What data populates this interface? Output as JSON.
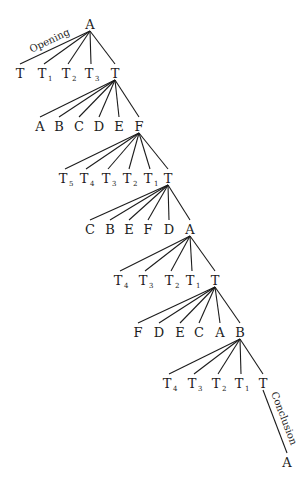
{
  "diagram": {
    "type": "tree",
    "ink_color": "#1c1c1c",
    "background": "#ffffff",
    "root": {
      "id": "n0",
      "label": "A",
      "sub": "",
      "x": 90,
      "y": 24
    },
    "levels": [
      {
        "parent": "n0",
        "nodes": [
          {
            "id": "l1_0",
            "label": "T",
            "sub": "",
            "x": 20,
            "y": 73
          },
          {
            "id": "l1_1",
            "label": "T",
            "sub": "1",
            "x": 44,
            "y": 73
          },
          {
            "id": "l1_2",
            "label": "T",
            "sub": "2",
            "x": 68,
            "y": 73
          },
          {
            "id": "l1_3",
            "label": "T",
            "sub": "3",
            "x": 91,
            "y": 73
          },
          {
            "id": "l1_4",
            "label": "T",
            "sub": "",
            "x": 115,
            "y": 73
          }
        ]
      },
      {
        "parent": "l1_4",
        "nodes": [
          {
            "id": "l2_0",
            "label": "A",
            "sub": "",
            "x": 40,
            "y": 126
          },
          {
            "id": "l2_1",
            "label": "B",
            "sub": "",
            "x": 59,
            "y": 126
          },
          {
            "id": "l2_2",
            "label": "C",
            "sub": "",
            "x": 79,
            "y": 126
          },
          {
            "id": "l2_3",
            "label": "D",
            "sub": "",
            "x": 99,
            "y": 126
          },
          {
            "id": "l2_4",
            "label": "E",
            "sub": "",
            "x": 119,
            "y": 126
          },
          {
            "id": "l2_5",
            "label": "F",
            "sub": "",
            "x": 139,
            "y": 126
          }
        ]
      },
      {
        "parent": "l2_5",
        "nodes": [
          {
            "id": "l3_0",
            "label": "T",
            "sub": "5",
            "x": 65,
            "y": 178
          },
          {
            "id": "l3_1",
            "label": "T",
            "sub": "4",
            "x": 86,
            "y": 178
          },
          {
            "id": "l3_2",
            "label": "T",
            "sub": "3",
            "x": 108,
            "y": 178
          },
          {
            "id": "l3_3",
            "label": "T",
            "sub": "2",
            "x": 129,
            "y": 178
          },
          {
            "id": "l3_4",
            "label": "T",
            "sub": "1",
            "x": 150,
            "y": 178
          },
          {
            "id": "l3_5",
            "label": "T",
            "sub": "",
            "x": 168,
            "y": 178
          }
        ]
      },
      {
        "parent": "l3_5",
        "nodes": [
          {
            "id": "l4_0",
            "label": "C",
            "sub": "",
            "x": 90,
            "y": 229
          },
          {
            "id": "l4_1",
            "label": "B",
            "sub": "",
            "x": 110,
            "y": 229
          },
          {
            "id": "l4_2",
            "label": "E",
            "sub": "",
            "x": 129,
            "y": 229
          },
          {
            "id": "l4_3",
            "label": "F",
            "sub": "",
            "x": 148,
            "y": 229
          },
          {
            "id": "l4_4",
            "label": "D",
            "sub": "",
            "x": 169,
            "y": 229
          },
          {
            "id": "l4_5",
            "label": "A",
            "sub": "",
            "x": 190,
            "y": 229
          }
        ]
      },
      {
        "parent": "l4_5",
        "nodes": [
          {
            "id": "l5_0",
            "label": "T",
            "sub": "4",
            "x": 120,
            "y": 280
          },
          {
            "id": "l5_1",
            "label": "T",
            "sub": "3",
            "x": 145,
            "y": 280
          },
          {
            "id": "l5_2",
            "label": "T",
            "sub": "2",
            "x": 171,
            "y": 280
          },
          {
            "id": "l5_3",
            "label": "T",
            "sub": "1",
            "x": 192,
            "y": 280
          },
          {
            "id": "l5_4",
            "label": "T",
            "sub": "",
            "x": 215,
            "y": 280
          }
        ]
      },
      {
        "parent": "l5_4",
        "nodes": [
          {
            "id": "l6_0",
            "label": "F",
            "sub": "",
            "x": 138,
            "y": 332
          },
          {
            "id": "l6_1",
            "label": "D",
            "sub": "",
            "x": 159,
            "y": 332
          },
          {
            "id": "l6_2",
            "label": "E",
            "sub": "",
            "x": 180,
            "y": 332
          },
          {
            "id": "l6_3",
            "label": "C",
            "sub": "",
            "x": 199,
            "y": 332
          },
          {
            "id": "l6_4",
            "label": "A",
            "sub": "",
            "x": 220,
            "y": 332
          },
          {
            "id": "l6_5",
            "label": "B",
            "sub": "",
            "x": 240,
            "y": 332
          }
        ]
      },
      {
        "parent": "l6_5",
        "nodes": [
          {
            "id": "l7_0",
            "label": "T",
            "sub": "4",
            "x": 169,
            "y": 383
          },
          {
            "id": "l7_1",
            "label": "T",
            "sub": "3",
            "x": 194,
            "y": 383
          },
          {
            "id": "l7_2",
            "label": "T",
            "sub": "2",
            "x": 218,
            "y": 383
          },
          {
            "id": "l7_3",
            "label": "T",
            "sub": "1",
            "x": 241,
            "y": 383
          },
          {
            "id": "l7_4",
            "label": "T",
            "sub": "",
            "x": 263,
            "y": 383
          }
        ]
      },
      {
        "parent": "l7_4",
        "nodes": [
          {
            "id": "l8_0",
            "label": "A",
            "sub": "",
            "x": 287,
            "y": 462
          }
        ]
      }
    ],
    "edge_labels": [
      {
        "text": "Opening",
        "from": "n0",
        "to": "l1_0",
        "side": "above"
      },
      {
        "text": "Conclusion",
        "from": "l7_4",
        "to": "l8_0",
        "side": "right"
      }
    ]
  }
}
